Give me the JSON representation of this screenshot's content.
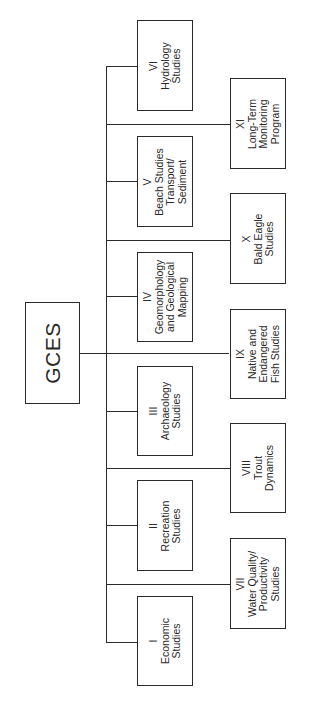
{
  "diagram": {
    "root": {
      "label": "GCES"
    },
    "left_branches": [
      {
        "numeral": "VI",
        "lines": [
          "Hydrology",
          "Studies"
        ]
      },
      {
        "numeral": "V",
        "lines": [
          "Beach Studies",
          "Transport/",
          "Sediment"
        ]
      },
      {
        "numeral": "IV",
        "lines": [
          "Geomorphology",
          "and Geological",
          "Mapping"
        ]
      },
      {
        "numeral": "III",
        "lines": [
          "Archaeology",
          "Studies"
        ]
      },
      {
        "numeral": "II",
        "lines": [
          "Recreation",
          "Studies"
        ]
      },
      {
        "numeral": "I",
        "lines": [
          "Economic",
          "Studies"
        ]
      }
    ],
    "right_branches": [
      {
        "numeral": "XI",
        "lines": [
          "Long-Term",
          "Monitoring",
          "Program"
        ]
      },
      {
        "numeral": "X",
        "lines": [
          "Bald Eagle",
          "Studies"
        ]
      },
      {
        "numeral": "IX",
        "lines": [
          "Native and",
          "Endangered",
          "Fish Studies"
        ]
      },
      {
        "numeral": "VIII",
        "lines": [
          "Trout",
          "Dynamics"
        ]
      },
      {
        "numeral": "VII",
        "lines": [
          "Water Quality/",
          "Productivity",
          "Studies"
        ]
      }
    ],
    "colors": {
      "line": "#2a2a2a",
      "background": "#ffffff"
    },
    "orientation": "rotated-90-ccw"
  }
}
